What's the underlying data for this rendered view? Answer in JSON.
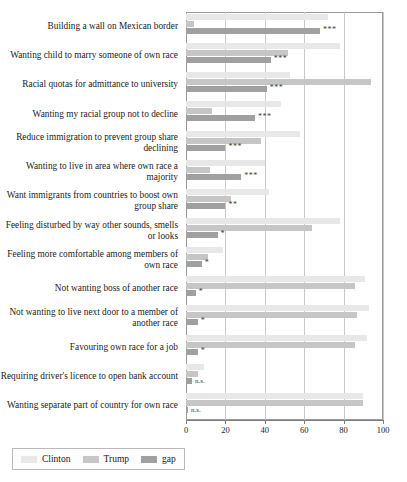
{
  "chart_data": {
    "type": "bar",
    "orientation": "horizontal",
    "title": "",
    "xlabel": "",
    "ylabel": "",
    "xlim": [
      0,
      100
    ],
    "xticks": [
      0,
      20,
      40,
      60,
      80,
      100
    ],
    "xtick_labels": [
      "0",
      "20",
      "40",
      "60",
      "80",
      "100"
    ],
    "grid": true,
    "legend_position": "bottom-left",
    "categories": [
      "Building a wall on Mexican border",
      "Wanting child to marry someone of own race",
      "Racial quotas for admittance to university",
      "Wanting my racial group not to decline",
      "Reduce immigration to prevent group share declining",
      "Wanting to live in area where own race a majority",
      "Want immigrants from countries to boost own group share",
      "Feeling disturbed by way other sounds, smells or looks",
      "Feeling more comfortable among members of own race",
      "Not wanting boss of another race",
      "Not wanting to live next door to a member of another race",
      "Favouring own race for a job",
      "Requiring driver's licence to open bank account",
      "Wanting separate part of country for own race"
    ],
    "series": [
      {
        "name": "Clinton",
        "color": "#e8e8e8",
        "values": [
          72,
          78,
          53,
          48,
          58,
          40,
          42,
          78,
          19,
          91,
          93,
          92,
          9,
          90
        ]
      },
      {
        "name": "Trump",
        "color": "#c6c6c6",
        "values": [
          4,
          52,
          94,
          13,
          38,
          12,
          23,
          64,
          11,
          86,
          87,
          86,
          6,
          90
        ]
      },
      {
        "name": "gap",
        "color": "#a0a0a0",
        "values": [
          68,
          43,
          41,
          35,
          20,
          28,
          20,
          16,
          8,
          5,
          6,
          6,
          3,
          1
        ]
      }
    ],
    "significance": [
      "***",
      "***",
      "***",
      "***",
      "***",
      "***",
      "**",
      "*",
      "*",
      "*",
      "*",
      "*",
      "n.s.",
      "n.s."
    ]
  },
  "legend": {
    "items": [
      {
        "label": "Clinton",
        "key": "clinton"
      },
      {
        "label": "Trump",
        "key": "trump"
      },
      {
        "label": "gap",
        "key": "gap"
      }
    ]
  }
}
